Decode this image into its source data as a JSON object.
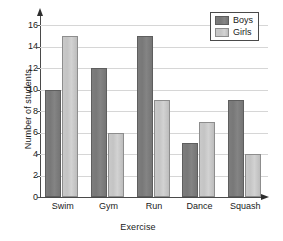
{
  "chart_data": {
    "type": "bar",
    "title": "",
    "xlabel": "Exercise",
    "ylabel": "Number of students",
    "categories": [
      "Swim",
      "Gym",
      "Run",
      "Dance",
      "Squash"
    ],
    "series": [
      {
        "name": "Boys",
        "values": [
          10,
          12,
          15,
          5,
          9
        ],
        "color": "#7d7d7d"
      },
      {
        "name": "Girls",
        "values": [
          15,
          6,
          9,
          7,
          4
        ],
        "color": "#c9c9c9"
      }
    ],
    "ylim": [
      0,
      16
    ],
    "ytick_step": 2,
    "yticks": [
      0,
      2,
      4,
      6,
      8,
      10,
      12,
      14,
      16
    ],
    "ytick_labels": [
      "0",
      "2",
      "4",
      "6",
      "8",
      "10",
      "12",
      "14",
      "16"
    ],
    "grid": true,
    "grid_axis": "y",
    "grid_color": "#d6d6d6",
    "legend": {
      "position": "top-right",
      "entries": [
        "Boys",
        "Girls"
      ]
    },
    "axis_arrows": true,
    "background": "#ffffff"
  }
}
